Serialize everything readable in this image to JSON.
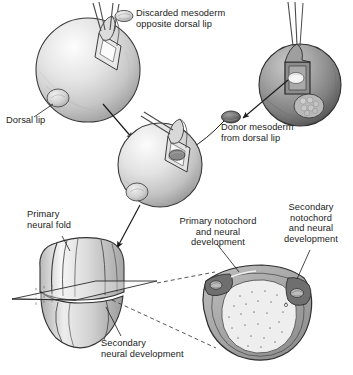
{
  "figure": {
    "background_color": "#ffffff",
    "ink_color": "#1b1b1b"
  },
  "labels": {
    "discarded_mesoderm": "Discarded mesoderm\nopposite dorsal lip",
    "dorsal_lip": "Dorsal lip",
    "donor_mesoderm": "Donor mesoderm\nfrom dorsal lip",
    "primary_neural_fold": "Primary\nneural fold",
    "primary_notochord": "Primary notochord\nand neural\ndevelopment",
    "secondary_notochord": "Secondary\nnotochord\nand neural\ndevelopment",
    "secondary_neural_development": "Secondary\nneural development"
  },
  "panels": [
    {
      "id": "host-embryo-top-left",
      "name": "host embryo, ventral side operated",
      "shading": "light",
      "features": [
        "incision flap",
        "microsurgical needles",
        "dorsal lip blob"
      ]
    },
    {
      "id": "donor-embryo-top-right",
      "name": "donor embryo, dorsal lip excised",
      "shading": "dark",
      "features": [
        "excision window",
        "microsurgical needles",
        "dorsal lip blob"
      ]
    },
    {
      "id": "host-embryo-middle",
      "name": "host embryo receiving graft",
      "shading": "light",
      "features": [
        "graft inserted in flap",
        "dorsal lip blob"
      ]
    },
    {
      "id": "neurula",
      "name": "neurula with primary and secondary neural folds",
      "features": [
        "primary neural fold",
        "secondary neural fold",
        "section plane"
      ]
    },
    {
      "id": "cross-section",
      "name": "transverse section through neurula",
      "features": [
        "primary notochord",
        "secondary notochord",
        "yolk mass"
      ]
    }
  ],
  "mesoderm_blobs": [
    {
      "id": "discarded",
      "tone": "light",
      "x": 124,
      "y": 16
    },
    {
      "id": "donor",
      "tone": "dark",
      "x": 231,
      "y": 117
    }
  ],
  "colors": {
    "sphere_light_highlight": "#fafafa",
    "sphere_light_mid": "#d9d9d9",
    "sphere_light_shadow": "#9a9a9a",
    "sphere_dark_highlight": "#bdbdbd",
    "sphere_dark_mid": "#8f8f8f",
    "sphere_dark_shadow": "#5a5a5a",
    "outline": "#2b2b2b",
    "notochord_dark": "#6f6f6f",
    "yolk_fill": "#ededed"
  }
}
